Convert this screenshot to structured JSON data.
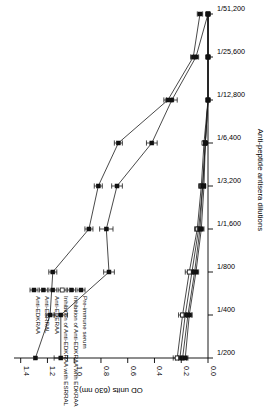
{
  "chart_data": {
    "type": "line",
    "title": "",
    "xlabel": "Anti-peptide antisera dilutions",
    "ylabel": "OD units (630 nm)",
    "x_tick_labels": [
      "1/200",
      "1/400",
      "1/800",
      "1/1,600",
      "1/3,200",
      "1/6,400",
      "1/12,800",
      "1/25,600",
      "1/51,200"
    ],
    "y_tick_labels": [
      "0.0",
      "0.2",
      "0.4",
      "0.6",
      "0.8",
      "1.0",
      "1.2",
      "1.4"
    ],
    "y_tick_values": [
      0.0,
      0.2,
      0.4,
      0.6,
      0.8,
      1.0,
      1.2,
      1.4
    ],
    "ylim": [
      0.0,
      1.45
    ],
    "x_scale": "categorical-log2-dilution",
    "grid": false,
    "legend_position": "top-left-inside",
    "error_bars": true,
    "series": [
      {
        "name": "Anti-EDKRAA",
        "marker": "filled-square",
        "values": [
          1.29,
          1.18,
          1.16,
          0.89,
          0.82,
          0.67,
          0.3,
          0.11,
          0.06
        ],
        "errors": [
          0.0,
          0.03,
          0.03,
          0.03,
          0.03,
          0.03,
          0.03,
          0.02,
          0.02
        ]
      },
      {
        "name": "Anti-ESRRAL",
        "marker": "filled-square",
        "values": [
          1.1,
          1.1,
          0.74,
          0.76,
          0.68,
          0.42,
          0.27,
          0.09,
          0.0
        ],
        "errors": [
          0.05,
          0.05,
          0.04,
          0.05,
          0.04,
          0.04,
          0.04,
          0.02,
          0.0
        ]
      },
      {
        "name": "Anti-EDERAA",
        "marker": "filled-square",
        "values": [
          0.21,
          0.17,
          0.12,
          0.07,
          0.04,
          0.02,
          0.0,
          0.0,
          0.0
        ],
        "errors": [
          0.03,
          0.03,
          0.03,
          0.02,
          0.02,
          0.01,
          0.0,
          0.0,
          0.0
        ]
      },
      {
        "name": "Inhibition of Anti-EDKRAA with ESRRAL",
        "marker": "open-square",
        "values": [
          0.23,
          0.19,
          0.14,
          0.08,
          0.05,
          0.03,
          0.0,
          0.0,
          0.0
        ],
        "errors": [
          0.03,
          0.03,
          0.03,
          0.02,
          0.02,
          0.01,
          0.0,
          0.0,
          0.0
        ]
      },
      {
        "name": "Inhibition of Anti-EDKRAA with EDKRAA",
        "marker": "filled-square",
        "values": [
          0.19,
          0.15,
          0.1,
          0.06,
          0.04,
          0.02,
          0.0,
          0.0,
          0.0
        ],
        "errors": [
          0.03,
          0.03,
          0.02,
          0.02,
          0.02,
          0.01,
          0.0,
          0.0,
          0.0
        ]
      },
      {
        "name": "Pre-immune serum",
        "marker": "filled-square",
        "values": [
          0.17,
          0.14,
          0.09,
          0.05,
          0.03,
          0.02,
          0.0,
          0.0,
          0.0
        ],
        "errors": [
          0.02,
          0.02,
          0.02,
          0.02,
          0.01,
          0.01,
          0.0,
          0.0,
          0.0
        ]
      }
    ]
  },
  "figure": {
    "axis_x_title": "Anti-peptide antisera dilutions",
    "axis_y_title": "OD units (630 nm)"
  },
  "legend": {
    "items": [
      {
        "label": "Anti-EDKRAA",
        "marker": "filled-square"
      },
      {
        "label": "Anti-ESRRAL",
        "marker": "filled-square"
      },
      {
        "label": "Anti-EDERAA",
        "marker": "filled-square"
      },
      {
        "label": "Inhibition of Anti-EDKRAA with ESRRAL",
        "marker": "open-square"
      },
      {
        "label": "Inhibition of Anti-EDKRAA with EDKRAA",
        "marker": "filled-square"
      },
      {
        "label": "Pre-immune serum",
        "marker": "filled-square"
      }
    ]
  }
}
